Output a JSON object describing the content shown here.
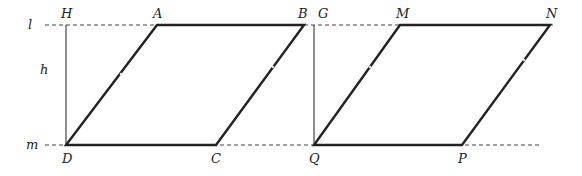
{
  "diagram": {
    "lines": {
      "top": {
        "label": "l",
        "y": 25,
        "x1": 45,
        "x2": 553
      },
      "bottom": {
        "label": "m",
        "y": 145,
        "x1": 45,
        "x2": 541
      }
    },
    "height_label": "h",
    "parallelogram_1": {
      "name": "ABCD",
      "vertices": {
        "A": [
          157,
          25
        ],
        "B": [
          304,
          25
        ],
        "C": [
          216,
          145
        ],
        "D": [
          66,
          145
        ]
      }
    },
    "parallelogram_2": {
      "name": "MNPQ",
      "vertices": {
        "M": [
          400,
          25
        ],
        "N": [
          550,
          25
        ],
        "P": [
          462,
          145
        ],
        "Q": [
          314,
          145
        ]
      }
    },
    "altitudes": [
      {
        "from": "H",
        "to": "D",
        "H": [
          66,
          25
        ]
      },
      {
        "from": "G",
        "to": "Q",
        "G": [
          314,
          25
        ]
      }
    ],
    "labels": {
      "l": "l",
      "m": "m",
      "h": "h",
      "H": "H",
      "A": "A",
      "B": "B",
      "G": "G",
      "M": "M",
      "N": "N",
      "D": "D",
      "C": "C",
      "Q": "Q",
      "P": "P"
    }
  }
}
